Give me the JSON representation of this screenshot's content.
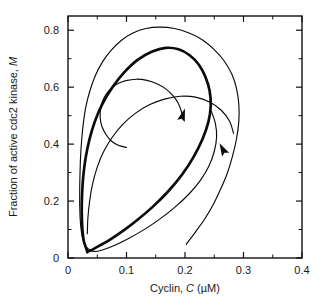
{
  "figure": {
    "background_color": "#ffffff",
    "ink_color": "#0b0b0b"
  },
  "chart_data": {
    "type": "line",
    "title": "",
    "subtitle": "",
    "xlabel": "Cyclin, C (µM)",
    "xlabel_parts": {
      "prefix": "Cyclin, ",
      "symbol": "C",
      "suffix": " (µM)"
    },
    "ylabel": "Fraction of active cdc2 kinase, M",
    "ylabel_parts": {
      "prefix": "Fraction of active cdc2 kinase, ",
      "symbol": "M",
      "suffix": ""
    },
    "xlim": [
      0,
      0.4
    ],
    "ylim": [
      0,
      0.85
    ],
    "xticks": [
      0,
      0.1,
      0.2,
      0.3,
      0.4
    ],
    "xtick_labels": [
      "0",
      "0.1",
      "0.2",
      "0.3",
      "0.4"
    ],
    "xticks_minor": [
      0.05,
      0.15,
      0.25,
      0.35
    ],
    "yticks": [
      0,
      0.2,
      0.4,
      0.6,
      0.8
    ],
    "ytick_labels": [
      "0",
      "0.2",
      "0.4",
      "0.6",
      "0.8"
    ],
    "yticks_minor": [
      0.1,
      0.3,
      0.5,
      0.7
    ],
    "grid": false,
    "legend": null,
    "legend_position": "none",
    "axis_frame": "box",
    "tick_direction": "in",
    "series": [
      {
        "name": "limit-cycle",
        "style": "thick-solid",
        "closed": true,
        "linewidth": 2.7,
        "points": [
          [
            0.033,
            0.023
          ],
          [
            0.027,
            0.06
          ],
          [
            0.0245,
            0.105
          ],
          [
            0.0235,
            0.16
          ],
          [
            0.024,
            0.22
          ],
          [
            0.026,
            0.285
          ],
          [
            0.03,
            0.35
          ],
          [
            0.0365,
            0.415
          ],
          [
            0.046,
            0.48
          ],
          [
            0.059,
            0.542
          ],
          [
            0.076,
            0.6
          ],
          [
            0.096,
            0.652
          ],
          [
            0.119,
            0.696
          ],
          [
            0.144,
            0.725
          ],
          [
            0.167,
            0.738
          ],
          [
            0.189,
            0.733
          ],
          [
            0.208,
            0.712
          ],
          [
            0.224,
            0.678
          ],
          [
            0.235,
            0.636
          ],
          [
            0.242,
            0.588
          ],
          [
            0.244,
            0.535
          ],
          [
            0.24,
            0.478
          ],
          [
            0.23,
            0.418
          ],
          [
            0.215,
            0.356
          ],
          [
            0.196,
            0.296
          ],
          [
            0.173,
            0.238
          ],
          [
            0.147,
            0.184
          ],
          [
            0.12,
            0.136
          ],
          [
            0.094,
            0.095
          ],
          [
            0.07,
            0.062
          ],
          [
            0.05,
            0.039
          ],
          [
            0.04,
            0.027
          ],
          [
            0.033,
            0.023
          ]
        ]
      },
      {
        "name": "outer-trajectory-spiraling-inward",
        "style": "thin-solid",
        "closed": false,
        "linewidth": 1.15,
        "arrow_at": {
          "x": 0.265,
          "y": 0.38,
          "direction": "up-left"
        },
        "points": [
          [
            0.202,
            0.048
          ],
          [
            0.218,
            0.092
          ],
          [
            0.234,
            0.138
          ],
          [
            0.248,
            0.187
          ],
          [
            0.26,
            0.238
          ],
          [
            0.272,
            0.296
          ],
          [
            0.281,
            0.356
          ],
          [
            0.288,
            0.418
          ],
          [
            0.292,
            0.48
          ],
          [
            0.292,
            0.54
          ],
          [
            0.288,
            0.596
          ],
          [
            0.28,
            0.646
          ],
          [
            0.267,
            0.692
          ],
          [
            0.25,
            0.732
          ],
          [
            0.23,
            0.766
          ],
          [
            0.207,
            0.79
          ],
          [
            0.182,
            0.806
          ],
          [
            0.157,
            0.811
          ],
          [
            0.133,
            0.806
          ],
          [
            0.111,
            0.79
          ],
          [
            0.091,
            0.764
          ],
          [
            0.074,
            0.73
          ],
          [
            0.059,
            0.689
          ],
          [
            0.047,
            0.642
          ],
          [
            0.038,
            0.591
          ],
          [
            0.031,
            0.536
          ],
          [
            0.0265,
            0.478
          ],
          [
            0.0235,
            0.418
          ],
          [
            0.0215,
            0.356
          ],
          [
            0.0205,
            0.294
          ],
          [
            0.02,
            0.232
          ],
          [
            0.0202,
            0.172
          ],
          [
            0.0215,
            0.118
          ],
          [
            0.0245,
            0.074
          ],
          [
            0.03,
            0.043
          ],
          [
            0.038,
            0.027
          ],
          [
            0.047,
            0.023
          ],
          [
            0.06,
            0.029
          ],
          [
            0.079,
            0.044
          ],
          [
            0.102,
            0.067
          ],
          [
            0.128,
            0.097
          ],
          [
            0.155,
            0.134
          ],
          [
            0.182,
            0.177
          ],
          [
            0.206,
            0.223
          ],
          [
            0.226,
            0.272
          ],
          [
            0.241,
            0.323
          ],
          [
            0.25,
            0.374
          ],
          [
            0.254,
            0.424
          ],
          [
            0.252,
            0.472
          ],
          [
            0.245,
            0.516
          ]
        ]
      },
      {
        "name": "inner-trajectory-spiraling-outward",
        "style": "thin-solid",
        "closed": false,
        "linewidth": 1.15,
        "arrow_at": {
          "x": 0.196,
          "y": 0.5,
          "direction": "up-right"
        },
        "points": [
          [
            0.1,
            0.388
          ],
          [
            0.086,
            0.396
          ],
          [
            0.074,
            0.411
          ],
          [
            0.065,
            0.434
          ],
          [
            0.058,
            0.462
          ],
          [
            0.055,
            0.494
          ],
          [
            0.056,
            0.528
          ],
          [
            0.061,
            0.56
          ],
          [
            0.07,
            0.588
          ],
          [
            0.083,
            0.61
          ],
          [
            0.099,
            0.623
          ],
          [
            0.117,
            0.628
          ],
          [
            0.135,
            0.624
          ],
          [
            0.152,
            0.612
          ],
          [
            0.167,
            0.594
          ],
          [
            0.179,
            0.571
          ],
          [
            0.188,
            0.545
          ],
          [
            0.193,
            0.52
          ],
          [
            0.1955,
            0.503
          ]
        ]
      },
      {
        "name": "inner-trajectory-lower-tail",
        "style": "thin-solid",
        "closed": false,
        "linewidth": 1.15,
        "points": [
          [
            0.033,
            0.085
          ],
          [
            0.034,
            0.14
          ],
          [
            0.037,
            0.2
          ],
          [
            0.042,
            0.26
          ],
          [
            0.05,
            0.319
          ],
          [
            0.061,
            0.374
          ],
          [
            0.076,
            0.425
          ],
          [
            0.094,
            0.47
          ],
          [
            0.115,
            0.508
          ],
          [
            0.139,
            0.538
          ],
          [
            0.165,
            0.558
          ],
          [
            0.192,
            0.568
          ],
          [
            0.218,
            0.565
          ],
          [
            0.242,
            0.548
          ],
          [
            0.262,
            0.519
          ],
          [
            0.276,
            0.481
          ],
          [
            0.283,
            0.438
          ]
        ]
      }
    ],
    "annotations": [
      {
        "name": "flow-arrow-outer",
        "x": 0.265,
        "y": 0.38,
        "label": ""
      },
      {
        "name": "flow-arrow-inner",
        "x": 0.196,
        "y": 0.5,
        "label": ""
      }
    ]
  }
}
